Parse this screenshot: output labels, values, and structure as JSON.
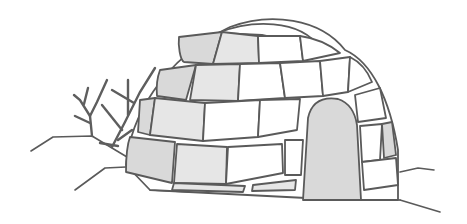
{
  "illustration": {
    "subject": "igloo",
    "elements": [
      "igloo-dome",
      "ice-blocks",
      "entrance-door",
      "bare-shrub",
      "snow-ground"
    ],
    "colors": {
      "outline": "#5a5a5a",
      "shaded_block": "#d9d9d9",
      "light_block": "#e6e6e6",
      "background": "#ffffff"
    }
  }
}
